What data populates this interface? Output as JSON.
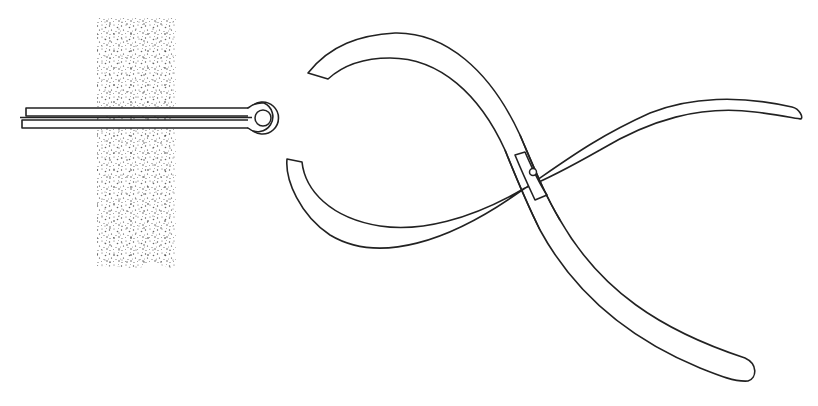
{
  "figure": {
    "description": "Line illustration: a split (cotter) pin passing through a stippled material block, beside an open pair of pliers",
    "elements": [
      {
        "name": "material-block",
        "style": "stippled"
      },
      {
        "name": "cotter-pin",
        "parts": [
          "prongs",
          "eye"
        ]
      },
      {
        "name": "pliers",
        "parts": [
          "upper-jaw-handle",
          "lower-jaw-handle",
          "pivot"
        ]
      }
    ],
    "colors": {
      "stroke": "#222222",
      "background": "#ffffff",
      "stipple": "#555555"
    }
  }
}
